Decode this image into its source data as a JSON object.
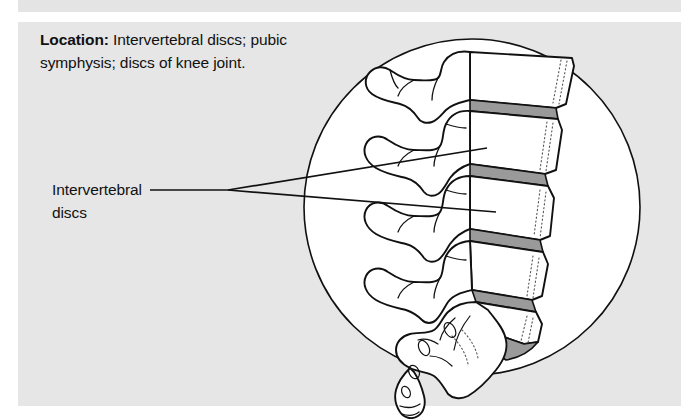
{
  "panel": {
    "background_color": "#e6e6e6",
    "page_background_color": "#ffffff"
  },
  "caption": {
    "lead_label": "Location:",
    "body_text": " Intervertebral discs; pubic symphysis; discs of knee joint.",
    "full_text": "Location: Intervertebral discs; pubic symphysis; discs of knee joint."
  },
  "callout": {
    "label_line_1": "Intervertebral",
    "label_line_2": "discs",
    "leader_line_count": 3,
    "leader_color": "#111111"
  },
  "illustration": {
    "name": "lateral-view-lumbar-spine",
    "circle_fill": "#ffffff",
    "circle_stroke": "#111111",
    "bone_outline_color": "#111111",
    "disc_fill": "#9a9a9a",
    "stipple_color": "#555555",
    "structures": [
      "lumbar vertebra L1",
      "lumbar vertebra L2",
      "lumbar vertebra L3",
      "lumbar vertebra L4",
      "lumbar vertebra L5",
      "intervertebral disc",
      "sacrum",
      "coccyx"
    ]
  }
}
